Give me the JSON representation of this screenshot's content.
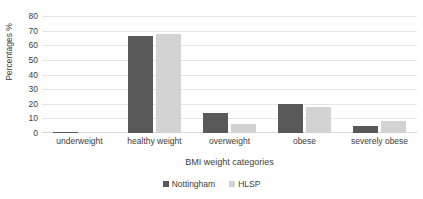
{
  "chart_data": {
    "type": "bar",
    "title": "",
    "xlabel": "BMI weight categories",
    "ylabel": "Percentages %",
    "categories": [
      "underweight",
      "healthy weight",
      "overweight",
      "obese",
      "severely obese"
    ],
    "series": [
      {
        "name": "Nottingham",
        "color": "#595959",
        "values": [
          1,
          66,
          14,
          20,
          5
        ]
      },
      {
        "name": "HLSP",
        "color": "#d3d3d3",
        "values": [
          0,
          68,
          6,
          17.5,
          8.5
        ]
      }
    ],
    "ylim": [
      0,
      80
    ],
    "yticks": [
      80,
      70,
      60,
      50,
      40,
      30,
      20,
      10,
      0
    ],
    "grid": true,
    "legend_position": "bottom"
  }
}
